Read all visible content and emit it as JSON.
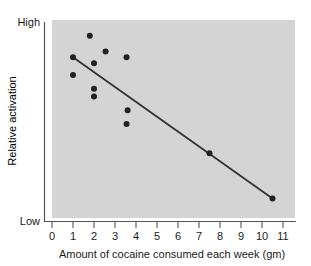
{
  "chart_data": {
    "type": "scatter",
    "title": "",
    "xlabel": "Amount of cocaine consumed each week (gm)",
    "ylabel": "Relative activation",
    "xlim": [
      0,
      11
    ],
    "ylim": [
      0,
      100
    ],
    "xticks": [
      "0",
      "1",
      "2",
      "3",
      "4",
      "5",
      "6",
      "7",
      "8",
      "9",
      "10",
      "11"
    ],
    "xtick_values": [
      0,
      1,
      2,
      3,
      4,
      5,
      6,
      7,
      8,
      9,
      10,
      11
    ],
    "ytick_labels": [
      "High",
      "Low"
    ],
    "ytick_values": [
      100,
      0
    ],
    "grid": false,
    "legend": false,
    "plot_background": "#d4d4d4",
    "point_color": "#222222",
    "line_color": "#333333",
    "axis_color": "#555555",
    "points": [
      {
        "x": 1.0,
        "y": 82
      },
      {
        "x": 1.0,
        "y": 73
      },
      {
        "x": 1.8,
        "y": 93
      },
      {
        "x": 2.0,
        "y": 79
      },
      {
        "x": 2.0,
        "y": 66
      },
      {
        "x": 2.0,
        "y": 62
      },
      {
        "x": 2.55,
        "y": 85
      },
      {
        "x": 3.55,
        "y": 82
      },
      {
        "x": 3.6,
        "y": 55
      },
      {
        "x": 3.55,
        "y": 48
      },
      {
        "x": 7.5,
        "y": 33
      },
      {
        "x": 10.5,
        "y": 10
      }
    ],
    "trendline": {
      "name": "regression line",
      "x1": 1.0,
      "y1": 82,
      "x2": 10.5,
      "y2": 10
    },
    "annotations": []
  }
}
